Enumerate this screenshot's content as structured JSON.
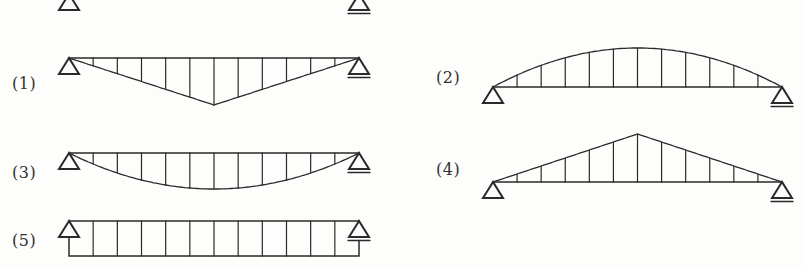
{
  "colors": {
    "background": "#fdfdfb",
    "line": "#2a2a2a",
    "label": "#333333"
  },
  "diagrams": [
    {
      "id": "1",
      "label": "(1)",
      "shape": "triangle-down",
      "beam": {
        "x1": 69,
        "x2": 359,
        "y": 58
      },
      "extreme_y": 105,
      "label_pos": {
        "x": 12,
        "y": 74
      }
    },
    {
      "id": "2",
      "label": "(2)",
      "shape": "parabola-up",
      "beam": {
        "x1": 493,
        "x2": 782,
        "y": 87
      },
      "extreme_y": 48,
      "label_pos": {
        "x": 436,
        "y": 68
      }
    },
    {
      "id": "3",
      "label": "(3)",
      "shape": "parabola-down",
      "beam": {
        "x1": 69,
        "x2": 359,
        "y": 153
      },
      "extreme_y": 189,
      "label_pos": {
        "x": 12,
        "y": 163
      }
    },
    {
      "id": "4",
      "label": "(4)",
      "shape": "triangle-up",
      "beam": {
        "x1": 493,
        "x2": 782,
        "y": 182
      },
      "extreme_y": 134,
      "label_pos": {
        "x": 436,
        "y": 160
      }
    },
    {
      "id": "5",
      "label": "(5)",
      "shape": "rectangle-down",
      "beam": {
        "x1": 69,
        "x2": 359,
        "y": 221
      },
      "extreme_y": 256,
      "label_pos": {
        "x": 12,
        "y": 231
      }
    }
  ],
  "hatch_intervals": 12,
  "top_partial_supports": [
    {
      "x": 69,
      "y": -6,
      "type": "pin"
    },
    {
      "x": 359,
      "y": -6,
      "type": "roller"
    }
  ]
}
